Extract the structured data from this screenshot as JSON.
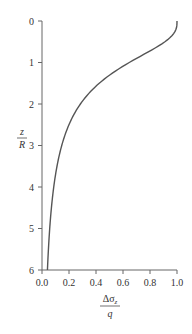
{
  "chart_data": {
    "type": "line",
    "title": "",
    "xlabel": "Δσ_z / q",
    "ylabel": "z / R",
    "xlabel_parts": {
      "numerator": "Δσ",
      "subscript": "z",
      "denominator": "q"
    },
    "ylabel_parts": {
      "numerator": "z",
      "denominator": "R"
    },
    "xlim": [
      0,
      1.0
    ],
    "ylim": [
      6,
      0
    ],
    "y_inverted": true,
    "grid": false,
    "legend": null,
    "x_ticks": [
      "0.0",
      "0.2",
      "0.4",
      "0.6",
      "0.8",
      "1.0"
    ],
    "y_ticks": [
      "0",
      "1",
      "2",
      "3",
      "4",
      "5",
      "6"
    ],
    "series": [
      {
        "name": "Stress under center of uniformly loaded circular area",
        "color": "#555555",
        "points": [
          {
            "z_over_R": 0.0,
            "ratio": 1.0
          },
          {
            "z_over_R": 0.25,
            "ratio": 0.986
          },
          {
            "z_over_R": 0.5,
            "ratio": 0.911
          },
          {
            "z_over_R": 0.75,
            "ratio": 0.784
          },
          {
            "z_over_R": 1.0,
            "ratio": 0.646
          },
          {
            "z_over_R": 1.25,
            "ratio": 0.524
          },
          {
            "z_over_R": 1.5,
            "ratio": 0.424
          },
          {
            "z_over_R": 1.75,
            "ratio": 0.346
          },
          {
            "z_over_R": 2.0,
            "ratio": 0.284
          },
          {
            "z_over_R": 2.5,
            "ratio": 0.2
          },
          {
            "z_over_R": 3.0,
            "ratio": 0.146
          },
          {
            "z_over_R": 3.5,
            "ratio": 0.111
          },
          {
            "z_over_R": 4.0,
            "ratio": 0.087
          },
          {
            "z_over_R": 4.5,
            "ratio": 0.07
          },
          {
            "z_over_R": 5.0,
            "ratio": 0.057
          },
          {
            "z_over_R": 5.5,
            "ratio": 0.048
          },
          {
            "z_over_R": 6.0,
            "ratio": 0.04
          }
        ]
      }
    ]
  },
  "colors": {
    "axis": "#666666",
    "curve": "#555555",
    "text": "#333333"
  }
}
